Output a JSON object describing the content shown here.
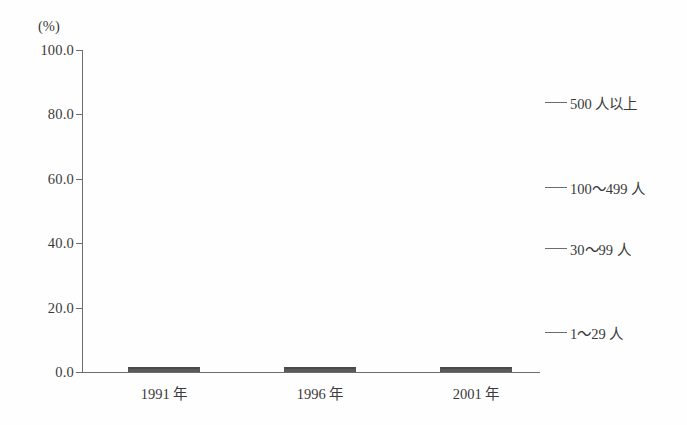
{
  "chart_data": {
    "type": "bar",
    "subtype": "stacked-100-percent",
    "title": "",
    "xlabel": "",
    "ylabel": "",
    "unit_label": "(%)",
    "categories": [
      "1991 年",
      "1996 年",
      "2001 年"
    ],
    "ylim": [
      0,
      100
    ],
    "ytick_labels": [
      "0.0",
      "20.0",
      "40.0",
      "60.0",
      "80.0",
      "100.0"
    ],
    "ytick_values": [
      0,
      20,
      40,
      60,
      80,
      100
    ],
    "grid": false,
    "legend_position": "right",
    "series": [
      {
        "name": "1～29 人",
        "pattern": "blank",
        "values": [
          50.0,
          36.0,
          29.0
        ]
      },
      {
        "name": "30～99 人",
        "pattern": "dotted",
        "values": [
          23.0,
          21.5,
          21.0
        ]
      },
      {
        "name": "100～499 人",
        "pattern": "diagonal-hatch",
        "values": [
          17.0,
          20.0,
          20.0
        ]
      },
      {
        "name": "500 人以上",
        "pattern": "solid-dark-gray",
        "values": [
          10.0,
          22.5,
          30.0
        ]
      }
    ]
  },
  "colors": {
    "axis": "#6d6d6d",
    "text": "#3a3a3a",
    "segment_500_plus": "#808080",
    "background": "#ffffff"
  }
}
